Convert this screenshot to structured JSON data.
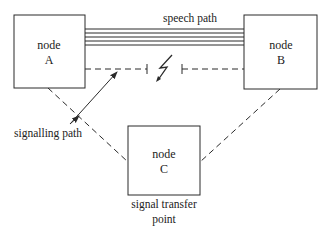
{
  "diagram": {
    "nodes": [
      {
        "id": "A",
        "line1": "node",
        "line2": "A"
      },
      {
        "id": "B",
        "line1": "node",
        "line2": "B"
      },
      {
        "id": "C",
        "line1": "node",
        "line2": "C"
      }
    ],
    "labels": {
      "speech_path": "speech path",
      "signalling_path": "signalling path",
      "stp_line1": "signal transfer",
      "stp_line2": "point"
    },
    "colors": {
      "stroke": "#2a2a2a",
      "background": "#ffffff"
    }
  }
}
